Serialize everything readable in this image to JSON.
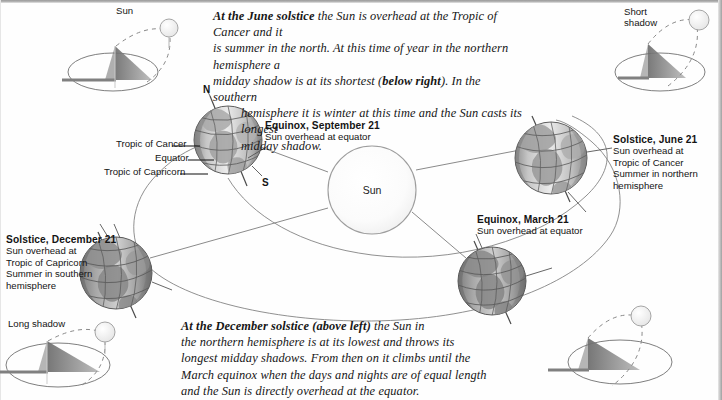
{
  "figure": {
    "title_implied": "Earth's orbit and the seasons",
    "center_body_label": "Sun"
  },
  "captions": {
    "june": {
      "lead": "At the June solstice",
      "line1_rest": " the Sun is overhead at the Tropic of Cancer and it",
      "line2": "is summer in the north. At this time of year in the northern hemisphere a",
      "line3_a": "midday shadow is at its shortest (",
      "line3_bold": "below right",
      "line3_b": "). In the southern",
      "line4": "hemisphere it is winter at this time and the Sun casts its longest",
      "line5": "midday shadow."
    },
    "december": {
      "lead": "At the December solstice",
      "line1_bold_paren": "(above left)",
      "line1_rest": " the Sun in",
      "line2": "the northern hemisphere is at its lowest and throws its",
      "line3": "longest midday shadows. From then on it climbs until the",
      "line4": "March equinox when the days and nights are of equal length",
      "line5": "and the Sun is directly overhead at the equator."
    }
  },
  "shadow_diagrams": {
    "top_left": {
      "sun_label": "Sun"
    },
    "top_right": {
      "shadow_label_line1": "Short",
      "shadow_label_line2": "shadow"
    },
    "bottom_left": {
      "shadow_label": "Long shadow"
    },
    "bottom_right": {
      "shadow_label": ""
    }
  },
  "globe_labels": {
    "equinox_september": {
      "heading": "Equinox, September 21",
      "line1": "Sun overhead at equator"
    },
    "solstice_june": {
      "heading": "Solstice, June 21",
      "line1": "Sun overhead at",
      "line2": "Tropic of Cancer",
      "line3": "Summer in northern",
      "line4": "hemisphere"
    },
    "solstice_december": {
      "heading": "Solstice, December 21",
      "line1": "Sun overhead at",
      "line2": "Tropic of Capricorn",
      "line3": "Summer in southern",
      "line4": "hemisphere"
    },
    "equinox_march": {
      "heading": "Equinox, March 21",
      "line1": "Sun overhead at equator"
    }
  },
  "earth_callouts": {
    "tropic_of_cancer": "Tropic of Cancer",
    "equator": "Equator",
    "tropic_of_capricorn": "Tropic of Capricorn",
    "north_pole": "N",
    "south_pole": "S"
  },
  "colors": {
    "page_background": "#fefefe",
    "ink": "#1a1a1a",
    "line": "#6f6f6f",
    "sun_fill": "#fafafa",
    "sun_stroke": "#9a9a9a",
    "globe_light": "#d8d8d8",
    "globe_dark": "#8d8d8d",
    "shadow_fill": "#8a8a8a",
    "border": "#9f9f9f"
  }
}
